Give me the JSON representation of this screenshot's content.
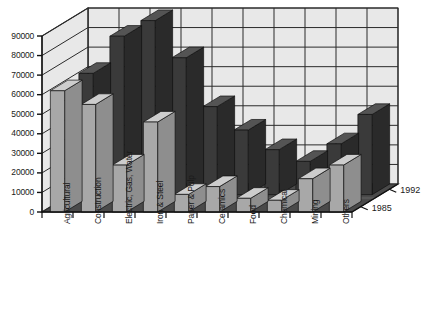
{
  "chart_data": {
    "type": "bar",
    "title": "",
    "subtitle": "",
    "xlabel": "",
    "ylabel": "",
    "zlabel": "",
    "style": "3d-grouped-bar",
    "grid": true,
    "legend_position": "depth-axis-right",
    "ylim": [
      0,
      90000
    ],
    "ytick_step": 10000,
    "ytick_labels": [
      "0",
      "10000",
      "20000",
      "30000",
      "40000",
      "50000",
      "60000",
      "70000",
      "80000",
      "90000"
    ],
    "ytick_values": [
      0,
      10000,
      20000,
      30000,
      40000,
      50000,
      60000,
      70000,
      80000,
      90000
    ],
    "categories": [
      "Agricultural",
      "Construction",
      "Electric, Gas, Water",
      "Iron & Steel",
      "Paper & Pulp",
      "Ceramics",
      "Food",
      "Chemical",
      "Mining",
      "Others"
    ],
    "depth_categories": [
      "1992",
      "1985"
    ],
    "series": [
      {
        "name": "1992",
        "row": "back",
        "color": "#3a3a3a",
        "values": [
          62000,
          81000,
          89000,
          70000,
          45000,
          33000,
          23000,
          17000,
          26000,
          41000
        ]
      },
      {
        "name": "1985",
        "row": "front",
        "color": "#a8a8a8",
        "values": [
          62000,
          55000,
          24000,
          46000,
          9000,
          13000,
          7000,
          6000,
          17000,
          24000
        ]
      }
    ],
    "colors": {
      "back_bar_face": "#3a3a3a",
      "back_bar_top": "#545454",
      "back_bar_side": "#2a2a2a",
      "front_bar_face": "#a8a8a8",
      "front_bar_top": "#cdcdcd",
      "front_bar_side": "#8e8e8e",
      "wall": "#e8e8e8",
      "floor": "#4a4a4a",
      "grid_line": "#2b2b2b",
      "axis_line": "#111111",
      "text": "#1a1a1a"
    }
  },
  "caption": {
    "text": ""
  }
}
